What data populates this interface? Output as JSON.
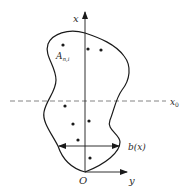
{
  "diagram": {
    "axes": {
      "vertical_label": "x",
      "horizontal_label": "y",
      "origin_label": "O"
    },
    "reference_line": {
      "label": "x",
      "label_subscript": "0",
      "style": "dashed"
    },
    "width_marker": {
      "label": "b(x)"
    },
    "point_label": {
      "base": "A",
      "subscript": "n,i"
    },
    "points": [
      {
        "x": 63,
        "y": 45
      },
      {
        "x": 88,
        "y": 49
      },
      {
        "x": 101,
        "y": 50
      },
      {
        "x": 65,
        "y": 106
      },
      {
        "x": 73,
        "y": 124
      },
      {
        "x": 89,
        "y": 121
      },
      {
        "x": 78,
        "y": 140
      },
      {
        "x": 90,
        "y": 158
      }
    ],
    "colors": {
      "stroke": "#1a1a1a",
      "dashed": "#777777",
      "background": "#ffffff"
    }
  }
}
